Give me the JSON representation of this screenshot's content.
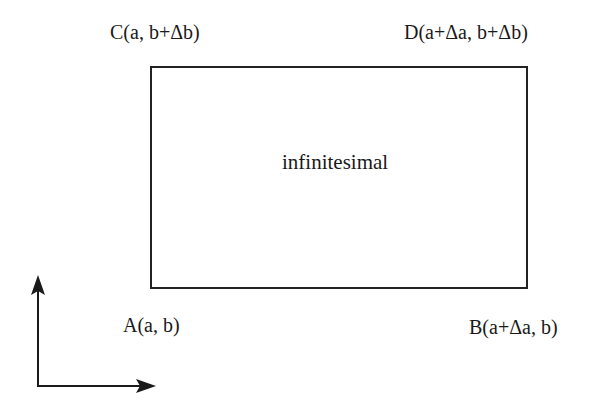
{
  "diagram": {
    "region_label": "infinitesimal",
    "corners": {
      "A": {
        "label": "A(a, b)"
      },
      "B": {
        "label": "B(a+Δa, b)"
      },
      "C": {
        "label": "C(a, b+Δb)"
      },
      "D": {
        "label": "D(a+Δa, b+Δb)"
      }
    },
    "axes": {
      "vertical": "up-arrow",
      "horizontal": "right-arrow"
    },
    "colors": {
      "stroke": "#222222",
      "text": "#1a1a1a",
      "background": "#ffffff"
    }
  }
}
